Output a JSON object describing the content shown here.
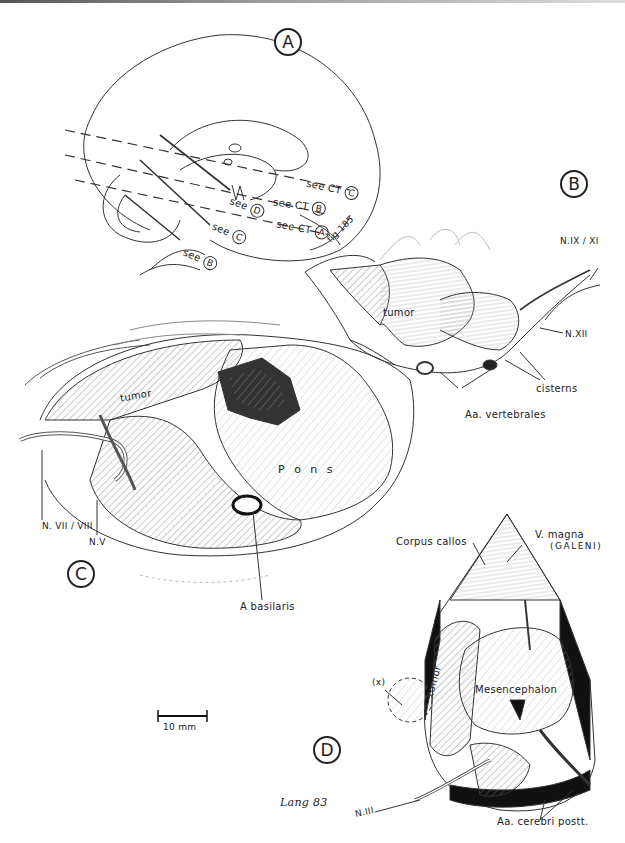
{
  "figure": {
    "panels": [
      {
        "id": "A",
        "label": "A"
      },
      {
        "id": "B",
        "label": "B"
      },
      {
        "id": "C",
        "label": "C"
      },
      {
        "id": "D",
        "label": "D"
      }
    ],
    "panel_a": {
      "refs": [
        "see CT C",
        "see CT B",
        "see CT A",
        "see D",
        "see C",
        "see B"
      ],
      "ref_ct_c": "see CT",
      "ref_ct_c_circle": "C",
      "ref_ct_b": "see CT",
      "ref_ct_b_circle": "B",
      "ref_ct_a": "see CT",
      "ref_ct_a_circle": "A",
      "ref_d": "see",
      "ref_d_circle": "D",
      "ref_c": "see",
      "ref_c_circle": "C",
      "ref_b": "see",
      "ref_b_circle": "B",
      "fig_ref": "fig 185"
    },
    "panel_b": {
      "tumor": "tumor",
      "n_ix_xi": "N.IX / XI",
      "n_xii": "N.XII",
      "cisterns": "cisterns",
      "aa_vertebrales": "Aa. vertebrales"
    },
    "panel_c": {
      "tumor": "tumor",
      "pons": "P o n s",
      "n_vii_viii": "N. VII / VIII",
      "n_v": "N.V",
      "a_basilaris": "A basilaris"
    },
    "panel_d": {
      "corpus_callos": "Corpus callos",
      "v_magna": "V. magna",
      "galeni": "(GALENI)",
      "tumor": "tumor",
      "mesencephalon": "Mesencephalon",
      "x_marker": "(x)",
      "n_iii": "N.III",
      "aa_cerebri_postt": "Aa. cerebri postt."
    },
    "scale_bar": {
      "label": "10 mm"
    },
    "signature": "Lang 83"
  }
}
